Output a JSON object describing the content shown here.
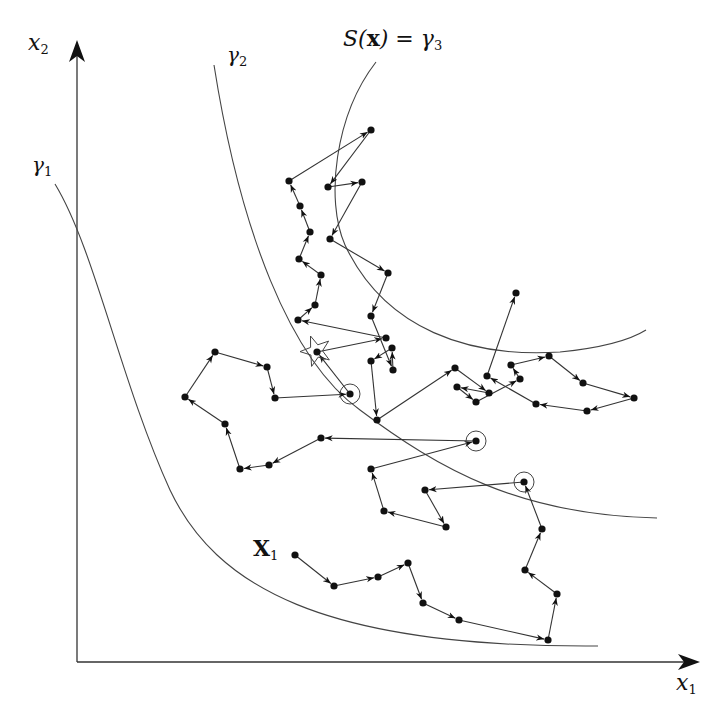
{
  "figure": {
    "stroke_color": "#333333",
    "point_color": "#111111",
    "background": "#ffffff"
  },
  "axes": {
    "x_label": "x",
    "x_label_sub": "1",
    "y_label": "x",
    "y_label_sub": "2",
    "origin": [
      77,
      662
    ],
    "x_end": [
      700,
      662
    ],
    "y_end": [
      77,
      40
    ]
  },
  "curves": {
    "gamma1": {
      "label": "γ",
      "sub": "1",
      "path": "M 55 184 C 95 250, 120 380, 170 490 C 215 585, 320 648, 598 646"
    },
    "gamma2": {
      "label": "γ",
      "sub": "2",
      "path": "M 214 65 C 240 230, 290 360, 360 410 C 440 470, 520 515, 657 518"
    },
    "gamma3": {
      "label_prefix": "S(",
      "label_bold": "x",
      "label_suffix": ") = γ",
      "sub": "3",
      "path": "M 376 62 C 335 115, 325 200, 345 245 C 385 330, 470 358, 560 352 C 600 348, 630 340, 646 330"
    }
  },
  "start_label": {
    "bold": "X",
    "sub": "1"
  },
  "paths": [
    {
      "name": "path-from-X1",
      "points": [
        [
          295,
          555
        ],
        [
          334,
          586
        ],
        [
          378,
          577
        ],
        [
          408,
          563
        ],
        [
          423,
          603
        ],
        [
          459,
          620
        ],
        [
          548,
          640
        ],
        [
          557,
          594
        ],
        [
          525,
          570
        ],
        [
          542,
          529
        ],
        [
          524,
          482
        ]
      ]
    },
    {
      "name": "path-from-circle-1",
      "points": [
        [
          524,
          482
        ],
        [
          425,
          490
        ],
        [
          446,
          527
        ],
        [
          384,
          511
        ],
        [
          371,
          469
        ],
        [
          476,
          441
        ]
      ]
    },
    {
      "name": "path-from-circle-2",
      "points": [
        [
          476,
          441
        ],
        [
          321,
          438
        ],
        [
          269,
          465
        ],
        [
          240,
          469
        ],
        [
          225,
          424
        ],
        [
          185,
          397
        ],
        [
          215,
          352
        ],
        [
          267,
          367
        ],
        [
          275,
          398
        ],
        [
          350,
          394
        ]
      ]
    },
    {
      "name": "path-from-circle-3",
      "points": [
        [
          350,
          394
        ],
        [
          317,
          352
        ],
        [
          386,
          338
        ],
        [
          298,
          320
        ],
        [
          315,
          305
        ],
        [
          321,
          275
        ],
        [
          299,
          259
        ],
        [
          310,
          232
        ],
        [
          300,
          206
        ],
        [
          289,
          181
        ],
        [
          371,
          130
        ],
        [
          328,
          187
        ],
        [
          362,
          182
        ],
        [
          330,
          239
        ],
        [
          388,
          273
        ],
        [
          371,
          316
        ],
        [
          393,
          370
        ],
        [
          392,
          348
        ],
        [
          371,
          361
        ],
        [
          377,
          420
        ],
        [
          455,
          368
        ],
        [
          489,
          393
        ],
        [
          457,
          387
        ],
        [
          476,
          402
        ],
        [
          520,
          379
        ],
        [
          511,
          365
        ],
        [
          549,
          356
        ],
        [
          583,
          383
        ],
        [
          634,
          398
        ],
        [
          587,
          411
        ],
        [
          536,
          404
        ],
        [
          487,
          376
        ],
        [
          516,
          293
        ]
      ]
    }
  ],
  "circled_points": [
    [
      524,
      482
    ],
    [
      476,
      441
    ],
    [
      350,
      394
    ]
  ],
  "star": {
    "center": [
      316,
      351
    ]
  }
}
